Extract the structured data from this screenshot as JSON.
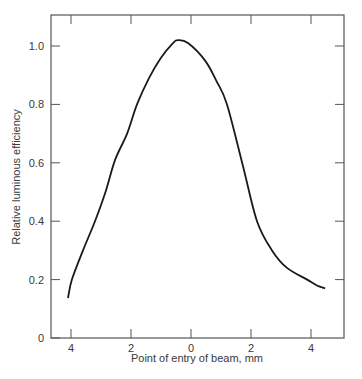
{
  "chart_data": {
    "type": "line",
    "title": "",
    "xlabel": "Point of entry of beam, mm",
    "ylabel": "Relative luminous efficiency",
    "xlim": [
      -4.6,
      5.1
    ],
    "ylim": [
      0,
      1.1
    ],
    "x_ticks": [
      -4,
      -2,
      0,
      2,
      4
    ],
    "x_tick_labels": [
      "4",
      "2",
      "0",
      "2",
      "4"
    ],
    "y_ticks": [
      0,
      0.2,
      0.4,
      0.6,
      0.8,
      1.0
    ],
    "y_tick_labels": [
      "0",
      "0.2",
      "0.4",
      "0.6",
      "0.8",
      "1.0"
    ],
    "grid": false,
    "legend": null,
    "series": [
      {
        "name": "Relative luminous efficiency",
        "color": "#1a1a1a",
        "x": [
          -4.1,
          -3.97,
          -3.6,
          -3.2,
          -2.85,
          -2.53,
          -2.13,
          -1.8,
          -1.4,
          -1.0,
          -0.6,
          -0.43,
          -0.1,
          0.47,
          0.85,
          1.2,
          1.73,
          2.2,
          2.7,
          3.2,
          3.87,
          4.2,
          4.47
        ],
        "y": [
          0.137,
          0.2,
          0.3,
          0.4,
          0.5,
          0.61,
          0.7,
          0.8,
          0.89,
          0.96,
          1.01,
          1.02,
          1.01,
          0.95,
          0.88,
          0.8,
          0.59,
          0.4,
          0.3,
          0.24,
          0.2,
          0.18,
          0.17
        ]
      }
    ]
  }
}
